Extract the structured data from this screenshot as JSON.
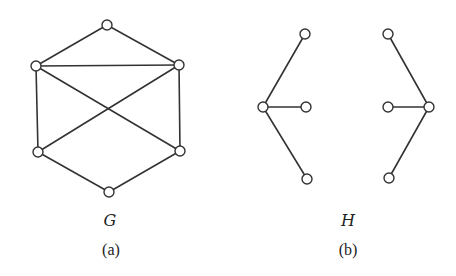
{
  "figure": {
    "background": "#ffffff",
    "stroke_color": "#333333",
    "node_radius": 5
  },
  "panels": [
    {
      "id": "a",
      "graph_name": "G",
      "caption": "(a)",
      "name_pos": [
        110,
        226
      ],
      "caption_pos": [
        111,
        255
      ],
      "nodes": [
        {
          "id": "top",
          "x": 107,
          "y": 25
        },
        {
          "id": "upper-left",
          "x": 36,
          "y": 66
        },
        {
          "id": "upper-right",
          "x": 179,
          "y": 65
        },
        {
          "id": "lower-left",
          "x": 38,
          "y": 152
        },
        {
          "id": "lower-right",
          "x": 180,
          "y": 151
        },
        {
          "id": "bottom",
          "x": 109,
          "y": 192
        }
      ],
      "edges": [
        [
          "top",
          "upper-left"
        ],
        [
          "top",
          "upper-right"
        ],
        [
          "upper-left",
          "upper-right"
        ],
        [
          "upper-left",
          "lower-left"
        ],
        [
          "upper-right",
          "lower-right"
        ],
        [
          "upper-left",
          "lower-right"
        ],
        [
          "upper-right",
          "lower-left"
        ],
        [
          "lower-left",
          "bottom"
        ],
        [
          "lower-right",
          "bottom"
        ]
      ]
    },
    {
      "id": "b",
      "graph_name": "H",
      "caption": "(b)",
      "name_pos": [
        348,
        226
      ],
      "caption_pos": [
        348,
        255
      ],
      "nodes": [
        {
          "id": "left-center",
          "x": 263,
          "y": 107
        },
        {
          "id": "left-top",
          "x": 305,
          "y": 34
        },
        {
          "id": "left-mid",
          "x": 306,
          "y": 107
        },
        {
          "id": "left-bottom",
          "x": 307,
          "y": 179
        },
        {
          "id": "right-center",
          "x": 429,
          "y": 107
        },
        {
          "id": "right-top",
          "x": 388,
          "y": 34
        },
        {
          "id": "right-mid",
          "x": 388,
          "y": 107
        },
        {
          "id": "right-bottom",
          "x": 389,
          "y": 178
        }
      ],
      "edges": [
        [
          "left-center",
          "left-top"
        ],
        [
          "left-center",
          "left-mid"
        ],
        [
          "left-center",
          "left-bottom"
        ],
        [
          "right-center",
          "right-top"
        ],
        [
          "right-center",
          "right-mid"
        ],
        [
          "right-center",
          "right-bottom"
        ]
      ]
    }
  ]
}
